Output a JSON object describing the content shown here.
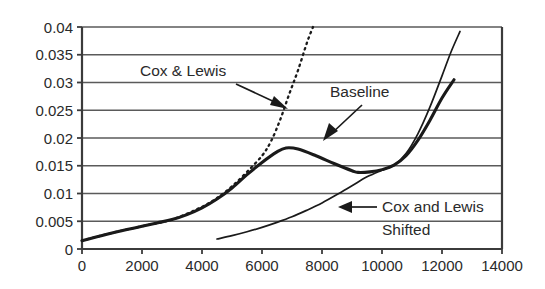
{
  "chart_data": {
    "type": "line",
    "title": "",
    "xlabel": "",
    "ylabel": "",
    "xlim": [
      0,
      14000
    ],
    "ylim": [
      0,
      0.04
    ],
    "grid": true,
    "legend_position": "inline-annotations",
    "x_ticks": [
      "0",
      "2000",
      "4000",
      "6000",
      "8000",
      "10000",
      "12000",
      "14000"
    ],
    "x_tick_values": [
      0,
      2000,
      4000,
      6000,
      8000,
      10000,
      12000,
      14000
    ],
    "y_ticks": [
      "0",
      "0.005",
      "0.01",
      "0.015",
      "0.02",
      "0.025",
      "0.03",
      "0.035",
      "0.04"
    ],
    "y_tick_values": [
      0,
      0.005,
      0.01,
      0.015,
      0.02,
      0.025,
      0.03,
      0.035,
      0.04
    ],
    "series": [
      {
        "name": "Baseline",
        "style": "solid-thick",
        "color": "#1a1a1a",
        "x": [
          0,
          500,
          1000,
          1500,
          2000,
          2500,
          3000,
          3500,
          4000,
          4500,
          5000,
          5500,
          6000,
          6500,
          6800,
          7200,
          7800,
          8400,
          9000,
          9200,
          9600,
          10000,
          10400,
          10800,
          11200,
          11600,
          12000,
          12400
        ],
        "y": [
          0.0015,
          0.0022,
          0.0029,
          0.0035,
          0.0041,
          0.0047,
          0.0053,
          0.0062,
          0.0074,
          0.009,
          0.011,
          0.0134,
          0.0156,
          0.0175,
          0.0182,
          0.018,
          0.0168,
          0.0154,
          0.0141,
          0.0138,
          0.0139,
          0.0143,
          0.0151,
          0.0168,
          0.0196,
          0.0232,
          0.0272,
          0.0305
        ]
      },
      {
        "name": "Cox & Lewis",
        "style": "dotted",
        "color": "#1a1a1a",
        "x": [
          0,
          1000,
          2000,
          3000,
          4000,
          4500,
          5000,
          5500,
          6000,
          6300,
          6600,
          6900,
          7200,
          7500,
          7700
        ],
        "y": [
          0.0015,
          0.0029,
          0.0041,
          0.0053,
          0.0076,
          0.0092,
          0.0113,
          0.0139,
          0.0168,
          0.0194,
          0.0232,
          0.0278,
          0.0322,
          0.0372,
          0.04
        ]
      },
      {
        "name": "Cox and Lewis Shifted",
        "style": "solid-thin",
        "color": "#1a1a1a",
        "x": [
          4500,
          5000,
          5500,
          6000,
          6500,
          7000,
          7500,
          8000,
          8500,
          9000,
          9500,
          10000,
          10400,
          10800,
          11200,
          11600,
          12000,
          12300,
          12600
        ],
        "y": [
          0.0018,
          0.0024,
          0.0031,
          0.0039,
          0.0048,
          0.0058,
          0.007,
          0.0083,
          0.0098,
          0.0114,
          0.013,
          0.0142,
          0.0151,
          0.0172,
          0.0208,
          0.0256,
          0.0312,
          0.0355,
          0.0392
        ]
      }
    ],
    "annotations": [
      {
        "id": "cox-lewis",
        "text": "Cox & Lewis",
        "text_x": 6,
        "text_y": 141,
        "arrow_from_x": 236,
        "arrow_from_y": 99,
        "arrow_to_x": 282,
        "arrow_to_y": 79
      },
      {
        "id": "baseline",
        "text": "Baseline",
        "text_x": 111,
        "text_y": 157,
        "arrow_from_x": 346,
        "arrow_from_y": 133,
        "arrow_to_x": 313,
        "arrow_to_y": 113
      },
      {
        "id": "cox-lewis-shifted-line1",
        "text": "Cox and Lewis",
        "text_x": 197,
        "text_y": 172
      },
      {
        "id": "cox-lewis-shifted-line2",
        "text": "Shifted",
        "text_x": 197,
        "text_y": 147
      }
    ]
  },
  "annotations_text": {
    "cox_lewis": "Cox & Lewis",
    "baseline": "Baseline",
    "shifted_line1": "Cox and Lewis",
    "shifted_line2": "Shifted"
  },
  "colors": {
    "curve": "#1a1a1a",
    "grid": "#5a5a5a",
    "axis": "#3b3b3b",
    "text": "#2a2a2a",
    "background": "#ffffff"
  }
}
